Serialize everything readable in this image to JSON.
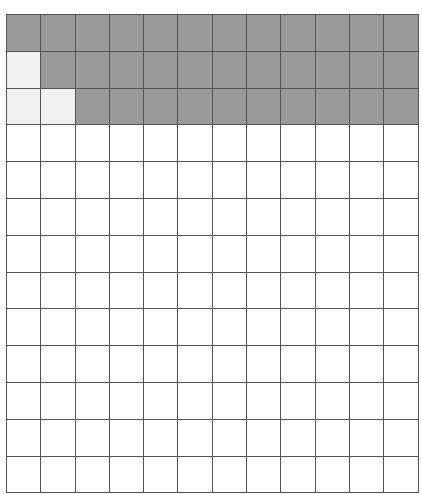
{
  "grid": {
    "columns": 12,
    "rows": 13,
    "colors": {
      "shaded": "#9a9a9a",
      "light": "#f0f0f0",
      "empty": "#ffffff",
      "line": "#555555"
    },
    "cells": [
      [
        "shaded",
        "shaded",
        "shaded",
        "shaded",
        "shaded",
        "shaded",
        "shaded",
        "shaded",
        "shaded",
        "shaded",
        "shaded",
        "shaded"
      ],
      [
        "light",
        "shaded",
        "shaded",
        "shaded",
        "shaded",
        "shaded",
        "shaded",
        "shaded",
        "shaded",
        "shaded",
        "shaded",
        "shaded"
      ],
      [
        "light",
        "light",
        "shaded",
        "shaded",
        "shaded",
        "shaded",
        "shaded",
        "shaded",
        "shaded",
        "shaded",
        "shaded",
        "shaded"
      ],
      [
        "empty",
        "empty",
        "empty",
        "empty",
        "empty",
        "empty",
        "empty",
        "empty",
        "empty",
        "empty",
        "empty",
        "empty"
      ],
      [
        "empty",
        "empty",
        "empty",
        "empty",
        "empty",
        "empty",
        "empty",
        "empty",
        "empty",
        "empty",
        "empty",
        "empty"
      ],
      [
        "empty",
        "empty",
        "empty",
        "empty",
        "empty",
        "empty",
        "empty",
        "empty",
        "empty",
        "empty",
        "empty",
        "empty"
      ],
      [
        "empty",
        "empty",
        "empty",
        "empty",
        "empty",
        "empty",
        "empty",
        "empty",
        "empty",
        "empty",
        "empty",
        "empty"
      ],
      [
        "empty",
        "empty",
        "empty",
        "empty",
        "empty",
        "empty",
        "empty",
        "empty",
        "empty",
        "empty",
        "empty",
        "empty"
      ],
      [
        "empty",
        "empty",
        "empty",
        "empty",
        "empty",
        "empty",
        "empty",
        "empty",
        "empty",
        "empty",
        "empty",
        "empty"
      ],
      [
        "empty",
        "empty",
        "empty",
        "empty",
        "empty",
        "empty",
        "empty",
        "empty",
        "empty",
        "empty",
        "empty",
        "empty"
      ],
      [
        "empty",
        "empty",
        "empty",
        "empty",
        "empty",
        "empty",
        "empty",
        "empty",
        "empty",
        "empty",
        "empty",
        "empty"
      ],
      [
        "empty",
        "empty",
        "empty",
        "empty",
        "empty",
        "empty",
        "empty",
        "empty",
        "empty",
        "empty",
        "empty",
        "empty"
      ],
      [
        "empty",
        "empty",
        "empty",
        "empty",
        "empty",
        "empty",
        "empty",
        "empty",
        "empty",
        "empty",
        "empty",
        "empty"
      ]
    ]
  }
}
